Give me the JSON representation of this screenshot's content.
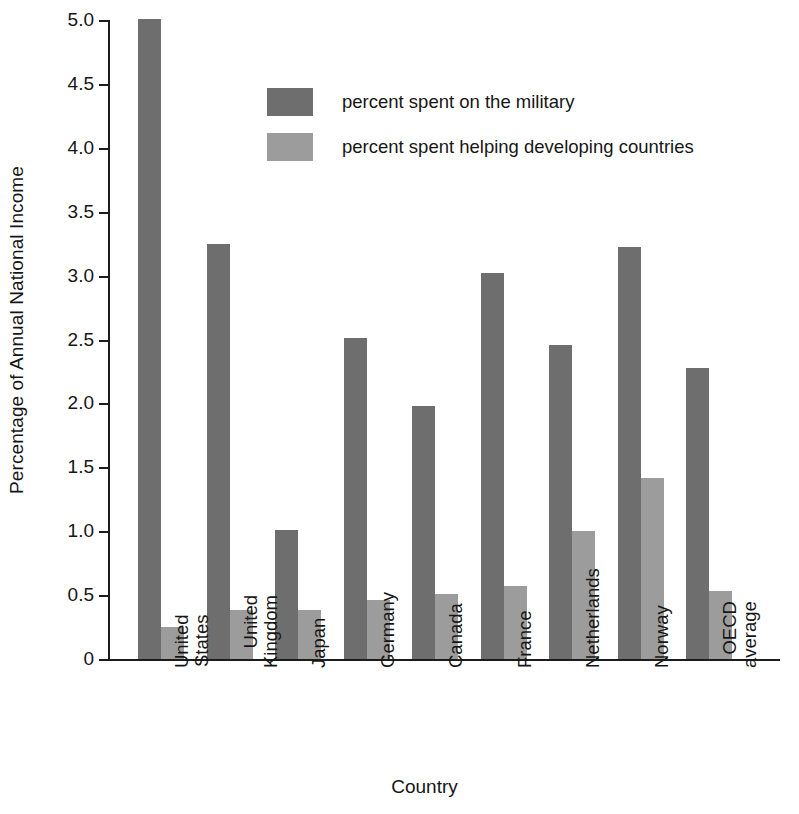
{
  "chart_data": {
    "type": "bar",
    "title": "",
    "xlabel": "Country",
    "ylabel": "Percentage of Annual National Income",
    "categories": [
      "United States",
      "United Kingdom",
      "Japan",
      "Germany",
      "Canada",
      "France",
      "Netherlands",
      "Norway",
      "OECD average"
    ],
    "category_lines": [
      [
        "United",
        "States"
      ],
      [
        "United",
        "Kingdom"
      ],
      [
        "Japan"
      ],
      [
        "Germany"
      ],
      [
        "Canada"
      ],
      [
        "France"
      ],
      [
        "Netherlands"
      ],
      [
        "Norway"
      ],
      [
        "OECD",
        "average"
      ]
    ],
    "series": [
      {
        "name": "percent spent on the military",
        "color": "#6e6e6e",
        "values": [
          5.01,
          3.25,
          1.01,
          2.51,
          1.98,
          3.02,
          2.46,
          3.22,
          2.28
        ]
      },
      {
        "name": "percent spent helping developing countries",
        "color": "#9c9c9c",
        "values": [
          0.25,
          0.38,
          0.38,
          0.46,
          0.51,
          0.57,
          1.0,
          1.42,
          0.53
        ]
      }
    ],
    "ylim": [
      0,
      5.0
    ],
    "yticks": [
      0,
      0.5,
      1.0,
      1.5,
      2.0,
      2.5,
      3.0,
      3.5,
      4.0,
      4.5,
      5.0
    ],
    "ytick_labels": [
      "0",
      "0.5",
      "1.0",
      "1.5",
      "2.0",
      "2.5",
      "3.0",
      "3.5",
      "4.0",
      "4.5",
      "5.0"
    ],
    "grid": false,
    "legend_position": "upper center"
  },
  "legend": {
    "items": [
      {
        "label": "percent spent on the military",
        "color": "#6e6e6e"
      },
      {
        "label": "percent spent helping developing countries",
        "color": "#9c9c9c"
      }
    ]
  },
  "axis": {
    "y_title": "Percentage of Annual National Income",
    "x_title": "Country"
  }
}
